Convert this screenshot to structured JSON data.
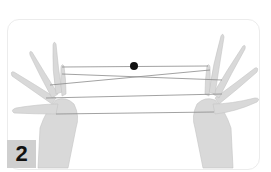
{
  "figure": {
    "step_label": "2",
    "colors": {
      "border": "#ececec",
      "badge_bg": "#cfcfcf",
      "badge_text": "#111111",
      "skin": "#dcdcdc",
      "string": "#8a8a8a",
      "bead": "#111111"
    }
  }
}
